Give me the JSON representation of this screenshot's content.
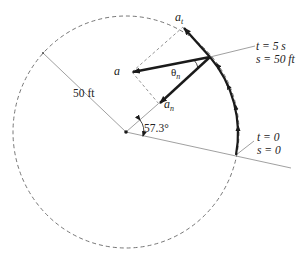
{
  "diagram": {
    "colors": {
      "ink": "#1a1a1a",
      "thin": "#777777",
      "dashed": "#666666"
    },
    "labels": {
      "a_t": "a",
      "a_t_sub": "t",
      "a": "a",
      "a_n": "a",
      "a_n_sub": "n",
      "theta_n": "θ",
      "theta_n_sub": "n",
      "radius": "50 ft",
      "angle": "57.3°",
      "end_t": "t = 5 s",
      "end_s": "s = 50 ft",
      "start_t": "t = 0",
      "start_s": "s = 0"
    }
  }
}
